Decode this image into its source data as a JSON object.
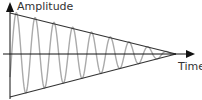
{
  "chart_data": {
    "type": "line",
    "title": "",
    "xlabel": "Time",
    "ylabel": "Amplitude",
    "series": [
      {
        "name": "oscillation",
        "color": "#aaaaaa",
        "cycles": 9,
        "decay": "linear"
      },
      {
        "name": "envelope-upper",
        "color": "#333333"
      },
      {
        "name": "envelope-lower",
        "color": "#333333"
      }
    ],
    "grid": false,
    "legend": "none"
  },
  "labels": {
    "y_axis": "Amplitude",
    "x_axis": "Time"
  },
  "colors": {
    "axis": "#111111",
    "envelope": "#333333",
    "wave": "#aaaaaa"
  }
}
